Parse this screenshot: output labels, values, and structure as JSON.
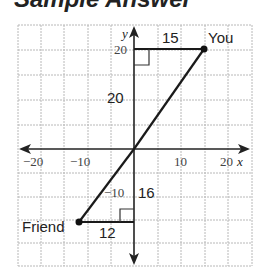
{
  "heading": "Sample Answer",
  "graph": {
    "x_axis_label": "x",
    "y_axis_label": "y",
    "x_tick_labels": [
      {
        "text": "−20",
        "value": -20
      },
      {
        "text": "−10",
        "value": -10
      },
      {
        "text": "10",
        "value": 10
      },
      {
        "text": "20",
        "value": 20
      }
    ],
    "y_tick_labels": [
      {
        "text": "20",
        "value": 20
      },
      {
        "text": "−10",
        "value": -10
      }
    ],
    "grid_step": 5,
    "range": {
      "x": [
        -25,
        25
      ],
      "y": [
        -25,
        25
      ]
    },
    "points": [
      {
        "label": "You",
        "x": 15,
        "y": 20
      },
      {
        "label": "Friend",
        "x": -12,
        "y": -16
      }
    ],
    "segment_labels": {
      "you_horizontal": "15",
      "you_vertical": "20",
      "friend_horizontal": "12",
      "friend_vertical": "16"
    }
  },
  "colors": {
    "grid": "#b8b8b8",
    "axis": "#222222",
    "line": "#1a1a1a",
    "text": "#222222"
  }
}
